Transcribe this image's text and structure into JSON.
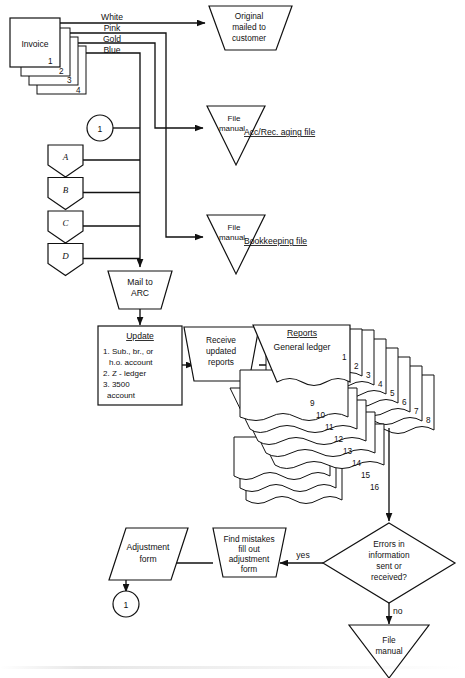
{
  "diagram": {
    "background": "#ffffff",
    "line_color": "#111111"
  },
  "invoice_stack": {
    "label": "Invoice",
    "copy_numbers": [
      "1",
      "2",
      "3",
      "4"
    ],
    "copy_colors": [
      "White",
      "Pink",
      "Gold",
      "Blue"
    ]
  },
  "nodes": {
    "original_mailed": "Original\nmailed to\ncustomer",
    "original_mailed_lines": [
      "Original",
      "mailed  to",
      "customer"
    ],
    "file_manual_1": [
      "File",
      "manual"
    ],
    "file_manual_1_caption": "Acc/Rec. aging file",
    "file_manual_2": [
      "File",
      "manual"
    ],
    "file_manual_2_caption": "Bookkeeping file",
    "mail_to_arc": [
      "Mail  to",
      "ARC"
    ],
    "update_title": "Update",
    "update_items": [
      "1. Sub., br., or",
      "h.o. account",
      "2. Z - ledger",
      "3. 3500",
      "account"
    ],
    "receive_reports": [
      "Receive",
      "updated",
      "reports"
    ],
    "reports_title": "Reports",
    "reports_subtitle": "General  ledger",
    "decision": [
      "Errors  in",
      "information",
      "sent  or",
      "received?"
    ],
    "find_mistakes": [
      "Find mistakes",
      "fill out",
      "adjustment",
      "form"
    ],
    "adjustment_form": [
      "Adjustment",
      "form"
    ],
    "file_manual_3": [
      "File",
      "manual"
    ]
  },
  "connectors": {
    "top_circle": "1",
    "bottom_circle": "1",
    "offpage": [
      "A",
      "B",
      "C",
      "D"
    ]
  },
  "edge_labels": {
    "yes": "yes",
    "no": "no"
  },
  "report_numbers": [
    "1",
    "2",
    "3",
    "4",
    "5",
    "6",
    "7",
    "8",
    "9",
    "10",
    "11",
    "12",
    "13",
    "14",
    "15",
    "16"
  ]
}
